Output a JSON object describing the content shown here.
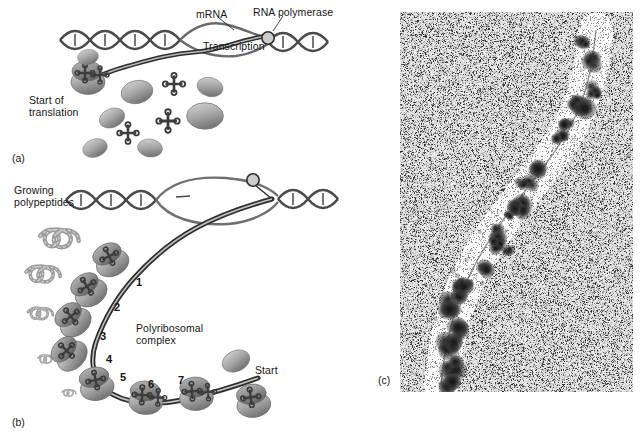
{
  "figure": {
    "panels": [
      {
        "id": "a",
        "label": "(a)",
        "caption": "Start of transcription and translation"
      },
      {
        "id": "b",
        "label": "(b)",
        "caption": "Polyribosomal complex with growing polypeptides"
      },
      {
        "id": "c",
        "label": "(c)",
        "caption": "Electron micrograph of polyribosomes"
      }
    ]
  },
  "panel_a": {
    "id_label": "(a)",
    "labels": {
      "mrna": "mRNA",
      "rna_polymerase": "RNA polymerase",
      "transcription": "Transcription",
      "start_of_translation_line1": "Start of",
      "start_of_translation_line2": "translation"
    },
    "elements": {
      "dna_strand": "dna-double-helix",
      "mrna_strand": "mrna-transcript",
      "polymerase_marker": "rna-polymerase-circle",
      "ribosome_count": 8,
      "trna_count": 4
    }
  },
  "panel_b": {
    "id_label": "(b)",
    "labels": {
      "growing_line1": "Growing",
      "growing_line2": "polypeptides",
      "complex_line1": "Polyribosomal",
      "complex_line2": "complex",
      "start": "Start"
    },
    "ribosome_numbers": [
      "1",
      "2",
      "3",
      "4",
      "5",
      "6",
      "7"
    ],
    "elements": {
      "dna_strand": "dna-double-helix",
      "transcription_bubble": "transcription-bubble",
      "mrna_strand": "mrna-transcript",
      "polymerase_marker": "rna-polymerase-circle",
      "polypeptide_count": 5
    }
  },
  "panel_c": {
    "id_label": "(c)",
    "image_type": "electron-micrograph",
    "description": "Grainy electron micrograph showing dark ribosome clusters along a diagonal nascent strand"
  },
  "colors": {
    "dna": "#4a4a4a",
    "mrna": "#3a3a3a",
    "ribosome_light": "#cfcfcf",
    "ribosome_mid": "#9a9a9a",
    "ribosome_dark": "#6f6f6f",
    "trna": "#3c3c3c",
    "polypeptide": "#9b9b9b",
    "text": "#161616",
    "micrograph_bg": "#d8d8d8"
  }
}
